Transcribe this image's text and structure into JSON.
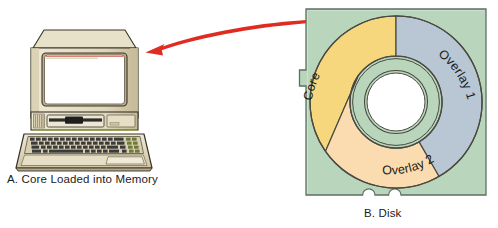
{
  "figure": {
    "background_color": "#ffffff",
    "width": 498,
    "height": 228
  },
  "panel_a": {
    "id": "A",
    "caption": "A. Core Loaded into Memory",
    "subject": "desktop-computer",
    "colors": {
      "case": "#e2dabf",
      "case_light": "#efe9d5",
      "case_shadow": "#c9bfa0",
      "case_dark": "#a89c7c",
      "screen": "#ffffff",
      "screen_border": "#6e6550",
      "outline": "#3a342a",
      "key": "#3b3b3b",
      "accent_green": "#9ba83c",
      "accent_red": "#c0392b"
    }
  },
  "arrow": {
    "label": "load-arrow",
    "direction": "disk-to-memory",
    "color": "#e02b20",
    "from_x": 312,
    "from_y": 20,
    "to_x": 148,
    "to_y": 49
  },
  "panel_b": {
    "id": "B",
    "caption": "B. Disk",
    "subject": "floppy-disk-sleeve",
    "sleeve": {
      "fill": "#b9d6bd",
      "stroke": "#5d6f63",
      "x": 305,
      "y": 8,
      "width": 182,
      "height": 188,
      "write_protect_notch": true,
      "bottom_notches": 2
    },
    "hub": {
      "fill": "#ffffff",
      "stroke": "#4a4a40"
    },
    "segments": [
      {
        "label": "Core",
        "color": "#f7d77e",
        "start_deg": 215,
        "end_deg": 270,
        "description": "gold segment, upper-left of ring"
      },
      {
        "label": "Overlay 1",
        "color": "#b9c6d4",
        "start_deg": 270,
        "end_deg": 420,
        "description": "blue-gray segment, upper-right of ring"
      },
      {
        "label": "Overlay 2",
        "color": "#fbdcb0",
        "start_deg": 60,
        "end_deg": 215,
        "description": "peach segment, lower portion of ring"
      }
    ]
  }
}
